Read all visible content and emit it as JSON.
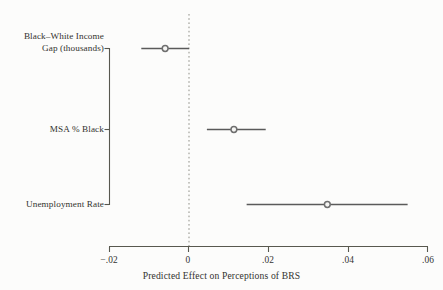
{
  "chart_data": {
    "type": "scatter",
    "title": "",
    "subtitle": "",
    "xlabel": "Predicted Effect on Perceptions of BRS",
    "ylabel": "",
    "xlim": [
      -0.02,
      0.06
    ],
    "xticks": [
      -0.02,
      0,
      0.02,
      0.04,
      0.06
    ],
    "xticklabels": [
      "−.02",
      "0",
      ".02",
      ".04",
      ".06"
    ],
    "grid": false,
    "legend": null,
    "reference_line": {
      "x": 0,
      "style": "dotted",
      "color": "#8a8a82"
    },
    "orientation": "horizontal",
    "categories": [
      "Black–White Income\nGap (thousands)",
      "MSA % Black",
      "Unemployment Rate"
    ],
    "category_labels_lines": [
      [
        "Black–White Income",
        "Gap (thousands)"
      ],
      [
        "MSA % Black"
      ],
      [
        "Unemployment Rate"
      ]
    ],
    "values": [
      -0.006,
      0.0113,
      0.0348
    ],
    "ci_low": [
      -0.012,
      0.0045,
      0.0145
    ],
    "ci_high": [
      0.0,
      0.0193,
      0.055
    ],
    "series": [
      {
        "name": "Predicted Effect",
        "points": [
          {
            "category": "Black–White Income Gap (thousands)",
            "estimate": -0.006,
            "ci_low": -0.012,
            "ci_high": 0.0
          },
          {
            "category": "MSA % Black",
            "estimate": 0.0113,
            "ci_low": 0.0045,
            "ci_high": 0.0193
          },
          {
            "category": "Unemployment Rate",
            "estimate": 0.0348,
            "ci_low": 0.0145,
            "ci_high": 0.055
          }
        ]
      }
    ],
    "marker_color": "#6f6f6f",
    "line_color": "#5a5a5a",
    "axis_color": "#55554f",
    "text_color": "#33332f",
    "background_color": "#fcfcfb"
  },
  "axis": {
    "x_title": "Predicted Effect on Perceptions of BRS",
    "tick_labels": [
      "−.02",
      "0",
      ".02",
      ".04",
      ".06"
    ]
  },
  "categories": {
    "row1_line1": "Black–White Income",
    "row1_line2": "Gap (thousands)",
    "row2": "MSA % Black",
    "row3": "Unemployment Rate"
  }
}
